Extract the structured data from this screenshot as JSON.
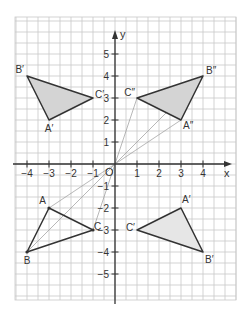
{
  "chart_data": {
    "type": "scatter",
    "title": "",
    "xlabel": "x",
    "ylabel": "y",
    "origin_label": "O",
    "xlim": [
      -4.5,
      5.5
    ],
    "ylim": [
      -6.2,
      6.7
    ],
    "grid": true,
    "grid_step": 0.5,
    "x_ticks": [
      -4,
      -3,
      -2,
      -1,
      1,
      2,
      3,
      4
    ],
    "y_ticks": [
      -5,
      -4,
      -3,
      -2,
      -1,
      1,
      2,
      3,
      4,
      5
    ],
    "x_tick_labels": [
      "−4",
      "−3",
      "−2",
      "−1",
      "1",
      "2",
      "3",
      "4"
    ],
    "y_tick_labels": [
      "−5",
      "−4",
      "−3",
      "−2",
      "−1",
      "1",
      "2",
      "3",
      "4",
      "5"
    ],
    "triangles": [
      {
        "name": "ABC",
        "filled": false,
        "vertices": [
          {
            "label": "A",
            "x": -3,
            "y": -2
          },
          {
            "label": "B",
            "x": -4,
            "y": -4
          },
          {
            "label": "C",
            "x": -1,
            "y": -3
          }
        ]
      },
      {
        "name": "A'B'C' (upper-left)",
        "filled": true,
        "vertices": [
          {
            "label": "A′",
            "x": -3,
            "y": 2
          },
          {
            "label": "B′",
            "x": -4,
            "y": 4
          },
          {
            "label": "C′",
            "x": -1,
            "y": 3
          }
        ]
      },
      {
        "name": "A'B'C' (lower-right)",
        "filled": true,
        "vertices": [
          {
            "label": "A′",
            "x": 3,
            "y": -2
          },
          {
            "label": "B′",
            "x": 4,
            "y": -4
          },
          {
            "label": "C′",
            "x": 1,
            "y": -3
          }
        ]
      },
      {
        "name": "A''B''C''",
        "filled": true,
        "vertices": [
          {
            "label": "A″",
            "x": 3,
            "y": 2
          },
          {
            "label": "B″",
            "x": 4,
            "y": 4
          },
          {
            "label": "C″",
            "x": 1,
            "y": 3
          }
        ]
      }
    ],
    "construction_lines": [
      {
        "from": [
          -3,
          -2
        ],
        "to": [
          3,
          2
        ]
      },
      {
        "from": [
          -4,
          -4
        ],
        "to": [
          4,
          4
        ]
      },
      {
        "from": [
          -1,
          -3
        ],
        "to": [
          1,
          3
        ]
      }
    ]
  },
  "colors": {
    "grid": "#c8c8c8",
    "axis": "#333333",
    "triangle_stroke": "#333333",
    "triangle_fill": "#d4d4d4",
    "triangle_fill_light": "#e6e6e6",
    "construction": "#9a9a9a"
  },
  "layout": {
    "origin_px": [
      115,
      164
    ],
    "unit_px": 22,
    "grid_left": 15,
    "grid_right": 236,
    "grid_top": 17,
    "grid_bottom": 300
  }
}
